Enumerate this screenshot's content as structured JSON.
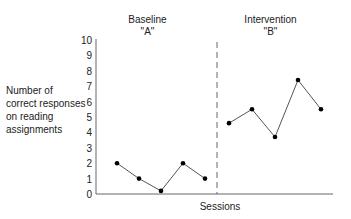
{
  "chart_data": {
    "type": "line",
    "title": "",
    "xlabel": "Sessions",
    "ylabel": "Number of correct responses on reading assignments",
    "ylim": [
      0,
      10
    ],
    "yticks": [
      0,
      1,
      2,
      3,
      4,
      5,
      6,
      7,
      8,
      9,
      10
    ],
    "grid": false,
    "legend": null,
    "phases": [
      {
        "name": "Baseline",
        "code": "\"A\""
      },
      {
        "name": "Intervention",
        "code": "\"B\""
      }
    ],
    "phase_change_line": {
      "style": "dashed",
      "between_sessions": [
        5,
        6
      ]
    },
    "x": [
      1,
      2,
      3,
      4,
      5,
      6,
      7,
      8,
      9,
      10
    ],
    "series": [
      {
        "name": "Baseline \"A\"",
        "x": [
          1,
          2,
          3,
          4,
          5
        ],
        "values": [
          2,
          1,
          0.2,
          2,
          1
        ]
      },
      {
        "name": "Intervention \"B\"",
        "x": [
          6,
          7,
          8,
          9,
          10
        ],
        "values": [
          4.6,
          5.5,
          3.7,
          7.4,
          5.5
        ]
      }
    ]
  },
  "labels": {
    "phase_a_name": "Baseline",
    "phase_a_code": "\"A\"",
    "phase_b_name": "Intervention",
    "phase_b_code": "\"B\"",
    "ylabel": "Number of correct responses on reading assignments",
    "xlabel": "Sessions"
  },
  "colors": {
    "axis": "#666666",
    "line": "#555555",
    "marker": "#000000",
    "text": "#222222"
  }
}
